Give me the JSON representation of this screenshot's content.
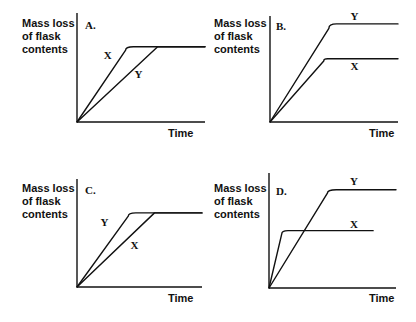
{
  "chart_data": [
    {
      "type": "line",
      "panel": "A.",
      "ylabel": [
        "Mass loss",
        "of flask",
        "contents"
      ],
      "xlabel": "Time",
      "x_range": [
        0,
        10
      ],
      "y_range": [
        0,
        10
      ],
      "series": [
        {
          "name": "X",
          "points": [
            [
              0,
              0
            ],
            [
              3.8,
              6.6
            ],
            [
              4.4,
              6.9
            ],
            [
              10,
              6.9
            ]
          ],
          "label_at": [
            2.4,
            5.8
          ]
        },
        {
          "name": "Y",
          "points": [
            [
              0,
              0
            ],
            [
              6.3,
              6.9
            ],
            [
              10,
              6.9
            ]
          ],
          "label_at": [
            4.8,
            4.0
          ]
        }
      ]
    },
    {
      "type": "line",
      "panel": "B.",
      "ylabel": [
        "Mass loss",
        "of flask",
        "contents"
      ],
      "xlabel": "Time",
      "x_range": [
        0,
        10
      ],
      "y_range": [
        0,
        10
      ],
      "series": [
        {
          "name": "Y",
          "points": [
            [
              0,
              0
            ],
            [
              4.6,
              8.6
            ],
            [
              5.2,
              9.0
            ],
            [
              10,
              9.0
            ]
          ],
          "label_at": [
            6.6,
            9.4
          ]
        },
        {
          "name": "X",
          "points": [
            [
              0,
              0
            ],
            [
              4.2,
              5.6
            ],
            [
              4.5,
              5.8
            ],
            [
              10,
              5.8
            ]
          ],
          "label_at": [
            6.6,
            4.8
          ]
        }
      ]
    },
    {
      "type": "line",
      "panel": "C.",
      "ylabel": [
        "Mass loss",
        "of flask",
        "contents"
      ],
      "xlabel": "Time",
      "x_range": [
        0,
        10
      ],
      "y_range": [
        0,
        10
      ],
      "series": [
        {
          "name": "Y",
          "points": [
            [
              0,
              0
            ],
            [
              4.1,
              6.5
            ],
            [
              4.7,
              6.8
            ],
            [
              10,
              6.8
            ]
          ],
          "label_at": [
            2.2,
            5.6
          ]
        },
        {
          "name": "X",
          "points": [
            [
              0,
              0
            ],
            [
              6.2,
              6.8
            ],
            [
              10,
              6.8
            ]
          ],
          "label_at": [
            4.6,
            3.5
          ]
        }
      ]
    },
    {
      "type": "line",
      "panel": "D.",
      "ylabel": [
        "Mass loss",
        "of flask",
        "contents"
      ],
      "xlabel": "Time",
      "x_range": [
        0,
        10
      ],
      "y_range": [
        0,
        10
      ],
      "series": [
        {
          "name": "Y",
          "points": [
            [
              0,
              0
            ],
            [
              4.6,
              8.1
            ],
            [
              5.3,
              8.4
            ],
            [
              10,
              8.4
            ]
          ],
          "label_at": [
            6.7,
            8.8
          ]
        },
        {
          "name": "X",
          "points": [
            [
              0,
              0
            ],
            [
              1.0,
              4.6
            ],
            [
              1.5,
              4.9
            ],
            [
              8.2,
              4.9
            ]
          ],
          "label_at": [
            6.7,
            5.1
          ]
        }
      ]
    }
  ]
}
